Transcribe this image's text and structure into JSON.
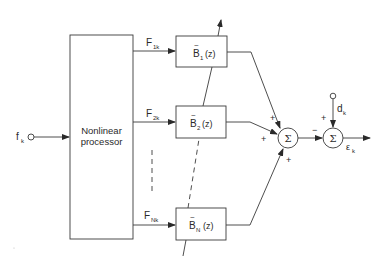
{
  "diagram": {
    "type": "block-diagram",
    "input": {
      "label": "f",
      "subscript": "k"
    },
    "processor": {
      "line1": "Nonlinear",
      "line2": "processor"
    },
    "branches": [
      {
        "signal": "F",
        "signal_sub": "1k",
        "filter": "B",
        "filter_sub": "1",
        "filter_arg": "(z)",
        "tilde": "~"
      },
      {
        "signal": "F",
        "signal_sub": "2k",
        "filter": "B",
        "filter_sub": "2",
        "filter_arg": "(z)",
        "tilde": "~"
      },
      {
        "signal": "F",
        "signal_sub": "Nk",
        "filter": "B",
        "filter_sub": "N",
        "filter_arg": "(z)",
        "tilde": "~"
      }
    ],
    "summer1": {
      "symbol": "Σ",
      "signs": [
        "+",
        "+",
        "+"
      ]
    },
    "summer2": {
      "symbol": "Σ",
      "sign_from_summer1": "−",
      "sign_from_desired": "+"
    },
    "desired": {
      "label": "d",
      "subscript": "k"
    },
    "error": {
      "label": "ε",
      "subscript": "k"
    }
  }
}
